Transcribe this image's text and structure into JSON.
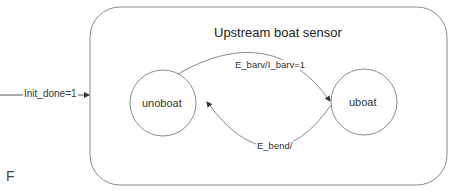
{
  "diagram": {
    "type": "state-machine",
    "superstate": {
      "title": "Upstream boat sensor"
    },
    "states": [
      {
        "id": "unoboat",
        "label": "unoboat"
      },
      {
        "id": "uboat",
        "label": "uboat"
      }
    ],
    "transitions": [
      {
        "from": "unoboat",
        "to": "uboat",
        "label": "E_barv/I_barv=1"
      },
      {
        "from": "uboat",
        "to": "unoboat",
        "label": "E_bend/"
      }
    ],
    "initial_transition": {
      "label": "Init_done=1"
    },
    "corner_letter": "F"
  },
  "colors": {
    "stroke": "#8a8a8a",
    "text": "#333333",
    "background": "#ffffff"
  }
}
